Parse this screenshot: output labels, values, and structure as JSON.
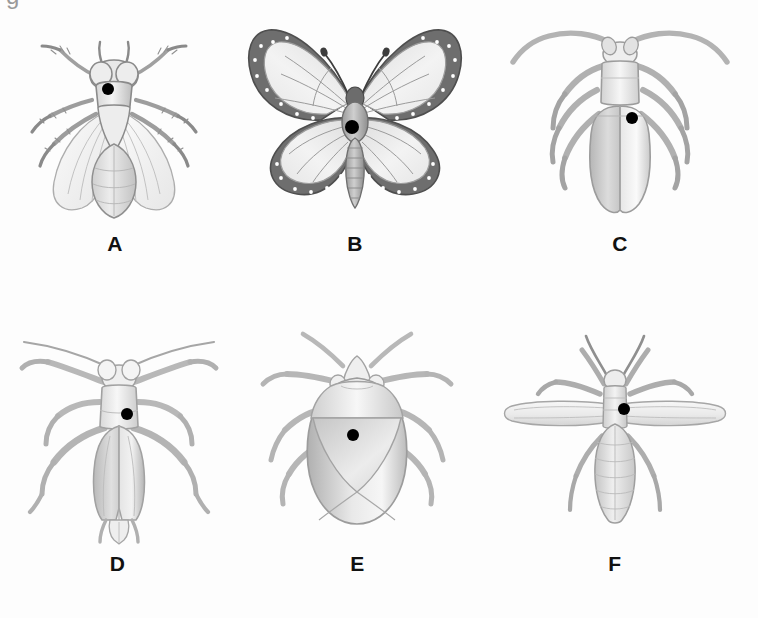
{
  "figure": {
    "background_color": "#fdfdfd",
    "cut_glyph": "g",
    "label_color": "#111111",
    "marker_color": "#000000",
    "marker_name": "black-dot-marker",
    "ink_color": "#6b6b6b",
    "body_light": "#f2f2f2",
    "body_mid": "#c9c9c9",
    "body_dark": "#8d8d8d",
    "wing_dark": "#6e6e6e"
  },
  "panels": [
    {
      "id": "A",
      "label": "A",
      "icon_name": "fly-illustration",
      "common_name": "fly",
      "x": 20,
      "y": 18,
      "w": 190,
      "h": 205,
      "label_y": 232,
      "marker": {
        "cx": 108,
        "cy": 89,
        "r": 6
      }
    },
    {
      "id": "B",
      "label": "B",
      "icon_name": "butterfly-illustration",
      "common_name": "butterfly",
      "x": 235,
      "y": 18,
      "w": 240,
      "h": 205,
      "label_y": 232,
      "marker": {
        "cx": 352,
        "cy": 127,
        "r": 7
      }
    },
    {
      "id": "C",
      "label": "C",
      "icon_name": "longhorn-beetle-illustration",
      "common_name": "beetle",
      "x": 505,
      "y": 18,
      "w": 230,
      "h": 205,
      "label_y": 232,
      "marker": {
        "cx": 632,
        "cy": 118,
        "r": 6
      }
    },
    {
      "id": "D",
      "label": "D",
      "icon_name": "katydid-illustration",
      "common_name": "katydid",
      "x": 10,
      "y": 330,
      "w": 215,
      "h": 215,
      "label_y": 562,
      "marker": {
        "cx": 117,
        "cy": 414,
        "r": 6
      }
    },
    {
      "id": "E",
      "label": "E",
      "icon_name": "stink-bug-illustration",
      "common_name": "stink bug",
      "x": 255,
      "y": 330,
      "w": 205,
      "h": 215,
      "label_y": 562,
      "marker": {
        "cx": 353,
        "cy": 435,
        "r": 6
      }
    },
    {
      "id": "F",
      "label": "F",
      "icon_name": "winged-termite-illustration",
      "common_name": "winged termite",
      "x": 500,
      "y": 330,
      "w": 230,
      "h": 215,
      "label_y": 562,
      "marker": {
        "cx": 624,
        "cy": 409,
        "r": 6
      }
    }
  ]
}
